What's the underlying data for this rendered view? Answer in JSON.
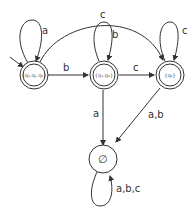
{
  "diagram": {
    "type": "DFA state diagram",
    "colors": {
      "stroke": "#333333",
      "background": "#ffffff",
      "text": "#333333"
    },
    "states": [
      {
        "id": "s0",
        "label": "{q₀,q₁,q₂}",
        "accepting": true,
        "initial": true
      },
      {
        "id": "s1",
        "label": "{q₁,q₂}",
        "accepting": true,
        "initial": false
      },
      {
        "id": "s2",
        "label": "{q₂}",
        "accepting": true,
        "initial": false
      },
      {
        "id": "s3",
        "label": "∅",
        "accepting": false,
        "initial": false
      }
    ],
    "transitions": [
      {
        "from": "s0",
        "to": "s0",
        "label": "a"
      },
      {
        "from": "s0",
        "to": "s1",
        "label": "b"
      },
      {
        "from": "s0",
        "to": "s2",
        "label": "c"
      },
      {
        "from": "s1",
        "to": "s1",
        "label": "b"
      },
      {
        "from": "s1",
        "to": "s2",
        "label": "c"
      },
      {
        "from": "s1",
        "to": "s3",
        "label": "a"
      },
      {
        "from": "s2",
        "to": "s2",
        "label": "c"
      },
      {
        "from": "s2",
        "to": "s3",
        "label": "a,b"
      },
      {
        "from": "s3",
        "to": "s3",
        "label": "a,b,c"
      }
    ]
  }
}
